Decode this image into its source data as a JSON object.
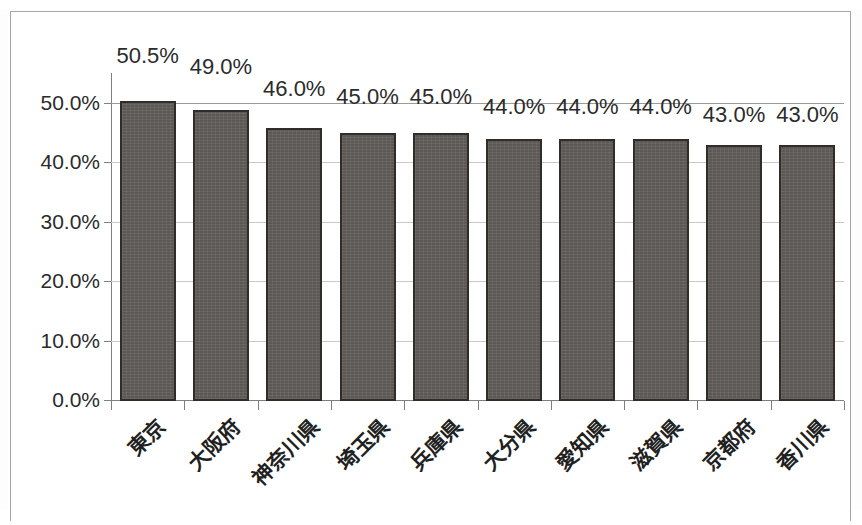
{
  "page": {
    "scan_ghost_left": "— ———",
    "scan_ghost_right": "—— —— —"
  },
  "chart_data": {
    "type": "bar",
    "title": "",
    "xlabel": "",
    "ylabel": "",
    "ylim": [
      0,
      55
    ],
    "grid": true,
    "legend": "none",
    "orientation": "vertical",
    "value_suffix": "%",
    "categories": [
      "東京",
      "大阪府",
      "神奈川県",
      "埼玉県",
      "兵庫県",
      "大分県",
      "愛知県",
      "滋賀県",
      "京都府",
      "香川県"
    ],
    "values": [
      50.5,
      49.0,
      46.0,
      45.0,
      45.0,
      44.0,
      44.0,
      44.0,
      43.0,
      43.0
    ],
    "data_labels": [
      "50.5%",
      "49.0%",
      "46.0%",
      "45.0%",
      "45.0%",
      "44.0%",
      "44.0%",
      "44.0%",
      "43.0%",
      "43.0%"
    ],
    "ytick_values": [
      0,
      10,
      20,
      30,
      40,
      50
    ],
    "ytick_labels": [
      "0.0%",
      "10.0%",
      "20.0%",
      "30.0%",
      "40.0%",
      "50.0%"
    ],
    "series_color": "#5b5856",
    "series_border_color": "#2f2c2a",
    "gridline_color": "#c9c9c9",
    "axis_color": "#7f7f7f"
  }
}
